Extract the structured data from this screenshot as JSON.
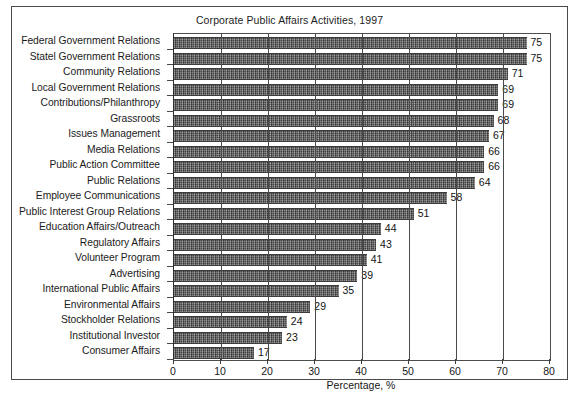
{
  "chart_data": {
    "type": "bar",
    "orientation": "horizontal",
    "title": "Corporate Public Affairs Activities, 1997",
    "xlabel": "Percentage, %",
    "ylabel": "",
    "xlim": [
      0,
      80
    ],
    "xticks": [
      0,
      10,
      20,
      30,
      40,
      50,
      60,
      70,
      80
    ],
    "grid": "vertical",
    "legend": "none",
    "bar_color": "#5e5e5e",
    "categories": [
      "Federal Government Relations",
      "Statel Government Relations",
      "Community Relations",
      "Local Government Relations",
      "Contributions/Philanthropy",
      "Grassroots",
      "Issues Management",
      "Media Relations",
      "Public Action Committee",
      "Public Relations",
      "Employee Communications",
      "Public Interest Group Relations",
      "Education Affairs/Outreach",
      "Regulatory Affairs",
      "Volunteer Program",
      "Advertising",
      "International Public Affairs",
      "Environmental Affairs",
      "Stockholder Relations",
      "Institutional Investor",
      "Consumer Affairs"
    ],
    "values": [
      75,
      75,
      71,
      69,
      69,
      68,
      67,
      66,
      66,
      64,
      58,
      51,
      44,
      43,
      41,
      39,
      35,
      29,
      24,
      23,
      17
    ]
  }
}
